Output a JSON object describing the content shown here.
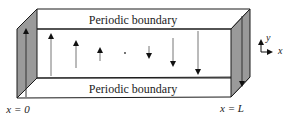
{
  "diagram": {
    "top_label": "Periodic boundary",
    "bottom_label": "Periodic boundary",
    "left_wall_label": "x = 0",
    "right_wall_label": "x = L",
    "axes": {
      "x_label": "x",
      "y_label": "y"
    },
    "colors": {
      "wall_fill": "#9a9a9a",
      "line": "#1a1a1a",
      "arrow": "#111111",
      "shaft": "#8a8a8a"
    },
    "arrows": [
      {
        "x": 26,
        "from_y": 97,
        "to_y": 29,
        "direction": "up",
        "location": "left-wall"
      },
      {
        "x": 51,
        "from_y": 76,
        "to_y": 34,
        "direction": "up"
      },
      {
        "x": 76,
        "from_y": 68,
        "to_y": 41,
        "direction": "up"
      },
      {
        "x": 100,
        "from_y": 61,
        "to_y": 48,
        "direction": "up"
      },
      {
        "x": 125,
        "from_y": 53,
        "to_y": 53,
        "direction": "none"
      },
      {
        "x": 149,
        "from_y": 46,
        "to_y": 58,
        "direction": "down"
      },
      {
        "x": 173,
        "from_y": 38,
        "to_y": 66,
        "direction": "down"
      },
      {
        "x": 198,
        "from_y": 31,
        "to_y": 74,
        "direction": "down"
      },
      {
        "x": 242,
        "from_y": 16,
        "to_y": 86,
        "direction": "down",
        "location": "right-wall"
      }
    ]
  }
}
